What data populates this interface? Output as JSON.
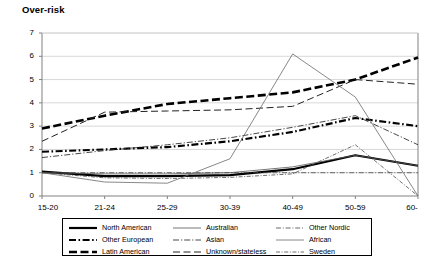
{
  "chart_data": {
    "type": "line",
    "title": "Over-risk",
    "xlabel": "",
    "ylabel": "Over-risk",
    "categories": [
      "15-20",
      "21-24",
      "25-29",
      "30-39",
      "40-49",
      "50-59",
      "60-"
    ],
    "ylim": [
      0,
      7
    ],
    "yticks": [
      0,
      1,
      2,
      3,
      4,
      5,
      6,
      7
    ],
    "grid": true,
    "legend_position": "bottom",
    "series": [
      {
        "name": "North American",
        "style": "solid-thick",
        "values": [
          1.05,
          0.85,
          0.85,
          0.9,
          1.15,
          1.75,
          1.3
        ]
      },
      {
        "name": "Other European",
        "style": "dash-dot-thick",
        "values": [
          1.9,
          2.0,
          2.1,
          2.35,
          2.75,
          3.35,
          3.0
        ]
      },
      {
        "name": "Latin American",
        "style": "dashed-thick",
        "values": [
          2.9,
          3.45,
          3.95,
          4.2,
          4.45,
          5.0,
          5.95
        ]
      },
      {
        "name": "Australian",
        "style": "solid-thin",
        "values": [
          1.0,
          0.95,
          0.95,
          1.0,
          1.25,
          1.75,
          1.3
        ]
      },
      {
        "name": "Asian",
        "style": "dash-dot-thin",
        "values": [
          1.65,
          1.95,
          2.2,
          2.5,
          2.95,
          3.45,
          2.2
        ]
      },
      {
        "name": "Unknown/stateless",
        "style": "dashed-thin",
        "values": [
          2.35,
          3.6,
          3.65,
          3.7,
          3.85,
          5.0,
          4.8
        ]
      },
      {
        "name": "Other Nordic",
        "style": "dash-dot-thin2",
        "values": [
          1.0,
          1.0,
          1.0,
          1.0,
          1.0,
          1.0,
          1.0
        ]
      },
      {
        "name": "African",
        "style": "solid-thin2",
        "values": [
          1.0,
          0.6,
          0.55,
          1.6,
          6.1,
          4.25,
          0.0
        ]
      },
      {
        "name": "Sweden",
        "style": "dash-dot-thin3",
        "values": [
          1.0,
          0.78,
          0.75,
          0.8,
          0.95,
          2.2,
          0.0
        ]
      }
    ]
  },
  "legend": {
    "columns": [
      [
        "North American",
        "Other European",
        "Latin American"
      ],
      [
        "Australian",
        "Asian",
        "Unknown/stateless"
      ],
      [
        "Other Nordic",
        "African",
        "Sweden"
      ]
    ]
  },
  "colors": {
    "line": "#000000",
    "grid": "#d8d8d8",
    "axis": "#808080",
    "background": "#ffffff"
  }
}
